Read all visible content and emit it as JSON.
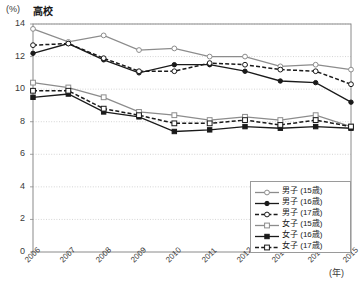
{
  "chart_title": "高校",
  "axis_unit_label": "(%)",
  "x_unit_label": "(年)",
  "legend": {
    "items": [
      {
        "label": "男子 (15歳)",
        "marker": "open-circle",
        "line": "solid",
        "color": "#8c8c8c"
      },
      {
        "label": "男子 (16歳)",
        "marker": "filled-circle",
        "line": "solid",
        "color": "#1a1a1a"
      },
      {
        "label": "男子 (17歳)",
        "marker": "open-circle",
        "line": "dashed",
        "color": "#1a1a1a"
      },
      {
        "label": "女子 (15歳)",
        "marker": "open-square",
        "line": "solid",
        "color": "#8c8c8c"
      },
      {
        "label": "女子 (16歳)",
        "marker": "filled-square",
        "line": "solid",
        "color": "#1a1a1a"
      },
      {
        "label": "女子 (17歳)",
        "marker": "open-square",
        "line": "dashed",
        "color": "#1a1a1a"
      }
    ]
  },
  "chart_data": {
    "type": "line",
    "title": "高校",
    "xlabel": "(年)",
    "ylabel": "(%)",
    "ylim": [
      0,
      14
    ],
    "ytick_values": [
      0,
      2,
      4,
      6,
      8,
      10,
      12,
      14
    ],
    "grid": true,
    "legend_position": "bottom-right",
    "categories": [
      "2006",
      "2007",
      "2008",
      "2009",
      "2010",
      "2011",
      "2012",
      "2013",
      "2014",
      "2015"
    ],
    "series": [
      {
        "name": "男子 (15歳)",
        "marker": "open-circle",
        "line": "solid",
        "color": "#8c8c8c",
        "values": [
          13.7,
          12.9,
          13.3,
          12.4,
          12.5,
          12.0,
          12.0,
          11.4,
          11.5,
          11.2
        ]
      },
      {
        "name": "男子 (16歳)",
        "marker": "filled-circle",
        "line": "solid",
        "color": "#1a1a1a",
        "values": [
          12.2,
          12.8,
          11.8,
          11.0,
          11.5,
          11.5,
          11.1,
          10.5,
          10.4,
          9.2
        ]
      },
      {
        "name": "男子 (17歳)",
        "marker": "open-circle",
        "line": "dashed",
        "color": "#1a1a1a",
        "values": [
          12.7,
          12.8,
          11.9,
          11.1,
          11.1,
          11.6,
          11.5,
          11.2,
          11.1,
          10.3
        ]
      },
      {
        "name": "女子 (15歳)",
        "marker": "open-square",
        "line": "solid",
        "color": "#8c8c8c",
        "values": [
          10.4,
          10.1,
          9.5,
          8.6,
          8.4,
          8.1,
          8.3,
          8.1,
          8.4,
          7.7
        ]
      },
      {
        "name": "女子 (16歳)",
        "marker": "filled-square",
        "line": "solid",
        "color": "#1a1a1a",
        "values": [
          9.5,
          9.7,
          8.6,
          8.3,
          7.4,
          7.5,
          7.7,
          7.6,
          7.7,
          7.6
        ]
      },
      {
        "name": "女子 (17歳)",
        "marker": "open-square",
        "line": "dashed",
        "color": "#1a1a1a",
        "values": [
          9.9,
          9.9,
          8.8,
          8.4,
          7.9,
          7.9,
          8.1,
          7.8,
          8.1,
          7.7
        ]
      }
    ]
  }
}
